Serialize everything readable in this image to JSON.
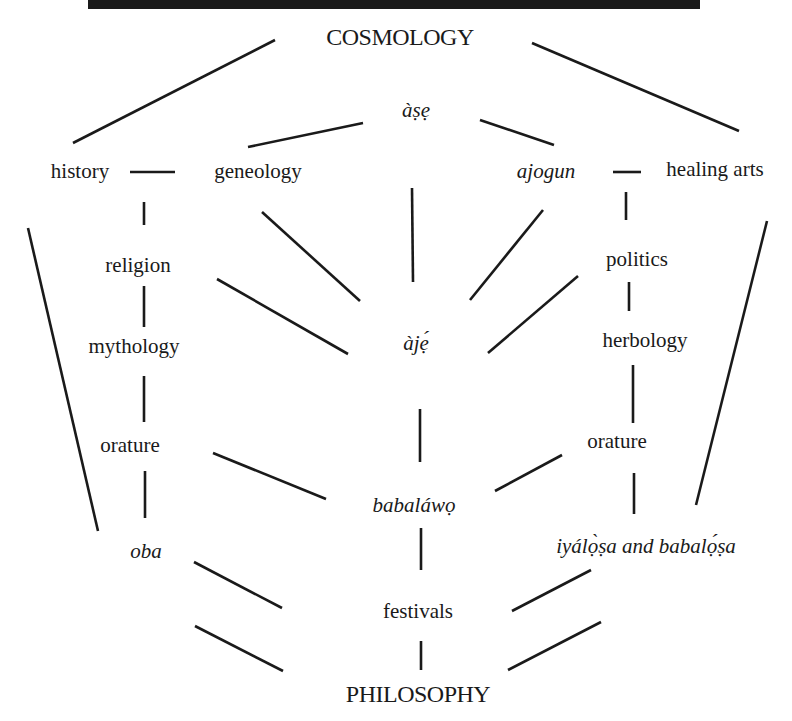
{
  "diagram": {
    "top_rule": {
      "x1": 58,
      "y1": 6,
      "x2": 467,
      "y2": 4,
      "color": "#1a1a1a",
      "width": 6
    },
    "nodes": [
      {
        "id": "cosmology",
        "label": "COSMOLOGY",
        "x": 400,
        "y": 37,
        "style": "caps"
      },
      {
        "id": "ase",
        "label": "àṣẹ",
        "x": 416,
        "y": 110,
        "style": "italic"
      },
      {
        "id": "history",
        "label": "history",
        "x": 80,
        "y": 171,
        "style": "normal"
      },
      {
        "id": "geneology",
        "label": "geneology",
        "x": 258,
        "y": 171,
        "style": "normal"
      },
      {
        "id": "ajogun",
        "label": "ajogun",
        "x": 546,
        "y": 171,
        "style": "italic"
      },
      {
        "id": "healing-arts",
        "label": "healing arts",
        "x": 715,
        "y": 169,
        "style": "normal"
      },
      {
        "id": "religion",
        "label": "religion",
        "x": 138,
        "y": 265,
        "style": "normal"
      },
      {
        "id": "politics",
        "label": "politics",
        "x": 637,
        "y": 259,
        "style": "normal"
      },
      {
        "id": "mythology",
        "label": "mythology",
        "x": 134,
        "y": 346,
        "style": "normal"
      },
      {
        "id": "aje",
        "label": "àjẹ́",
        "x": 416,
        "y": 343,
        "style": "italic"
      },
      {
        "id": "herbology",
        "label": "herbology",
        "x": 645,
        "y": 340,
        "style": "normal"
      },
      {
        "id": "orature-left",
        "label": "orature",
        "x": 130,
        "y": 445,
        "style": "normal"
      },
      {
        "id": "orature-right",
        "label": "orature",
        "x": 617,
        "y": 441,
        "style": "normal"
      },
      {
        "id": "babalawo",
        "label": "babaláwọ",
        "x": 414,
        "y": 505,
        "style": "italic"
      },
      {
        "id": "oba",
        "label": "oba",
        "x": 146,
        "y": 551,
        "style": "italic"
      },
      {
        "id": "iyalosa",
        "label": "iyálọ̀ṣa and babalọ́ṣa",
        "x": 646,
        "y": 546,
        "style": "italic"
      },
      {
        "id": "festivals",
        "label": "festivals",
        "x": 418,
        "y": 611,
        "style": "normal"
      },
      {
        "id": "philosophy",
        "label": "PHILOSOPHY",
        "x": 418,
        "y": 694,
        "style": "caps"
      }
    ],
    "edges": [
      {
        "from": "cosmology",
        "to": "history",
        "x1": 275,
        "y1": 40,
        "x2": 73,
        "y2": 143
      },
      {
        "from": "cosmology",
        "to": "healing-arts",
        "x1": 532,
        "y1": 43,
        "x2": 739,
        "y2": 131
      },
      {
        "from": "ase",
        "to": "geneology",
        "x1": 363,
        "y1": 123,
        "x2": 248,
        "y2": 147
      },
      {
        "from": "ase",
        "to": "ajogun",
        "x1": 480,
        "y1": 120,
        "x2": 554,
        "y2": 145
      },
      {
        "from": "history",
        "to": "geneology",
        "x1": 130,
        "y1": 172,
        "x2": 175,
        "y2": 172
      },
      {
        "from": "ajogun",
        "to": "healing-arts",
        "x1": 613,
        "y1": 172,
        "x2": 641,
        "y2": 172
      },
      {
        "from": "history",
        "to": "religion",
        "x1": 144,
        "y1": 202,
        "x2": 144,
        "y2": 225
      },
      {
        "from": "ajogun",
        "to": "politics",
        "x1": 626,
        "y1": 192,
        "x2": 626,
        "y2": 220
      },
      {
        "from": "ase",
        "to": "aje",
        "x1": 412,
        "y1": 188,
        "x2": 413,
        "y2": 282
      },
      {
        "from": "geneology",
        "to": "aje",
        "x1": 262,
        "y1": 212,
        "x2": 360,
        "y2": 301
      },
      {
        "from": "ajogun",
        "to": "aje",
        "x1": 543,
        "y1": 210,
        "x2": 470,
        "y2": 300
      },
      {
        "from": "religion",
        "to": "aje",
        "x1": 217,
        "y1": 279,
        "x2": 348,
        "y2": 354
      },
      {
        "from": "politics",
        "to": "aje",
        "x1": 578,
        "y1": 276,
        "x2": 488,
        "y2": 353
      },
      {
        "from": "history",
        "to": "oba",
        "x1": 28,
        "y1": 228,
        "x2": 98,
        "y2": 531
      },
      {
        "from": "healing-arts",
        "to": "iyalosa",
        "x1": 767,
        "y1": 221,
        "x2": 696,
        "y2": 505
      },
      {
        "from": "religion",
        "to": "mythology",
        "x1": 144,
        "y1": 286,
        "x2": 144,
        "y2": 327
      },
      {
        "from": "politics",
        "to": "herbology",
        "x1": 629,
        "y1": 282,
        "x2": 629,
        "y2": 311
      },
      {
        "from": "mythology",
        "to": "orature-left",
        "x1": 144,
        "y1": 376,
        "x2": 144,
        "y2": 422
      },
      {
        "from": "herbology",
        "to": "orature-right",
        "x1": 633,
        "y1": 365,
        "x2": 633,
        "y2": 423
      },
      {
        "from": "aje",
        "to": "babalawo",
        "x1": 420,
        "y1": 409,
        "x2": 420,
        "y2": 462
      },
      {
        "from": "orature-left",
        "to": "babalawo",
        "x1": 213,
        "y1": 453,
        "x2": 326,
        "y2": 499
      },
      {
        "from": "orature-right",
        "to": "babalawo",
        "x1": 562,
        "y1": 455,
        "x2": 495,
        "y2": 491
      },
      {
        "from": "orature-left",
        "to": "oba",
        "x1": 145,
        "y1": 471,
        "x2": 145,
        "y2": 518
      },
      {
        "from": "orature-right",
        "to": "iyalosa",
        "x1": 634,
        "y1": 473,
        "x2": 634,
        "y2": 514
      },
      {
        "from": "babalawo",
        "to": "festivals",
        "x1": 421,
        "y1": 528,
        "x2": 421,
        "y2": 570
      },
      {
        "from": "oba",
        "to": "festivals",
        "x1": 194,
        "y1": 562,
        "x2": 282,
        "y2": 608
      },
      {
        "from": "iyalosa",
        "to": "festivals",
        "x1": 591,
        "y1": 570,
        "x2": 512,
        "y2": 611
      },
      {
        "from": "oba",
        "to": "philosophy",
        "x1": 195,
        "y1": 626,
        "x2": 283,
        "y2": 671
      },
      {
        "from": "festivals",
        "to": "philosophy",
        "x1": 421,
        "y1": 641,
        "x2": 421,
        "y2": 670
      },
      {
        "from": "iyalosa",
        "to": "philosophy",
        "x1": 601,
        "y1": 622,
        "x2": 508,
        "y2": 670
      }
    ],
    "line_color": "#1a1a1a",
    "line_width": 2.6
  }
}
